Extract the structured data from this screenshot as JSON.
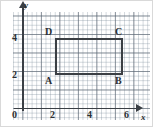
{
  "figure": {
    "axes": {
      "x_name": "x",
      "y_name": "y",
      "origin_label": "0",
      "x_ticks": [
        "2",
        "4",
        "6"
      ],
      "y_ticks": [
        "2",
        "4"
      ],
      "x_range": [
        0,
        7
      ],
      "y_range": [
        0,
        5.2
      ],
      "grid": "minor and major gridlines shown",
      "axis_color": "#3a3f45",
      "grid_color": "#7887 96",
      "major_grid_color": "#5a6470"
    },
    "vertices": {
      "A": {
        "label": "A",
        "x": 2,
        "y": 2
      },
      "B": {
        "label": "B",
        "x": 6,
        "y": 2
      },
      "C": {
        "label": "C",
        "x": 6,
        "y": 4
      },
      "D": {
        "label": "D",
        "x": 2,
        "y": 4
      }
    },
    "shape": {
      "name": "rectangle",
      "outline_color": "#3b3f44",
      "width_units": 4,
      "height_units": 2
    }
  },
  "chart_data": {
    "type": "scatter",
    "title": "",
    "xlabel": "x",
    "ylabel": "y",
    "xlim": [
      0,
      7
    ],
    "ylim": [
      0,
      5.2
    ],
    "xticks": [
      0,
      2,
      4,
      6
    ],
    "yticks": [
      0,
      2,
      4
    ],
    "grid": true,
    "legend": "none",
    "series": [
      {
        "name": "Rectangle ABCD",
        "point_labels": [
          "A",
          "B",
          "C",
          "D"
        ],
        "x": [
          2,
          6,
          6,
          2
        ],
        "y": [
          2,
          2,
          4,
          4
        ],
        "closed_polygon": true
      }
    ],
    "annotations": [
      {
        "text": "A",
        "x": 2,
        "y": 2,
        "position": "below-left"
      },
      {
        "text": "B",
        "x": 6,
        "y": 2,
        "position": "below-left"
      },
      {
        "text": "C",
        "x": 6,
        "y": 4,
        "position": "above-left"
      },
      {
        "text": "D",
        "x": 2,
        "y": 4,
        "position": "above-left"
      }
    ]
  }
}
